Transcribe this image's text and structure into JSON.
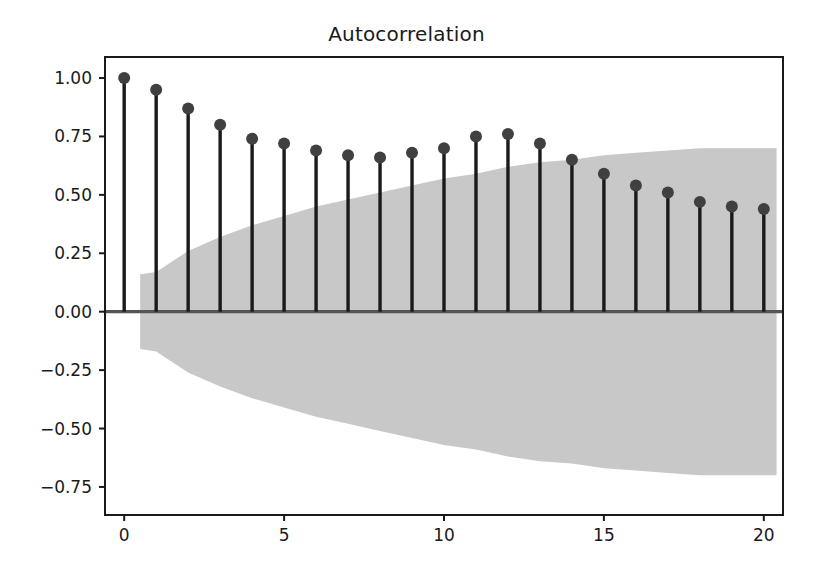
{
  "chart_data": {
    "type": "line",
    "plot_style": "stem",
    "title": "Autocorrelation",
    "xlabel": "",
    "ylabel": "",
    "x": [
      0,
      1,
      2,
      3,
      4,
      5,
      6,
      7,
      8,
      9,
      10,
      11,
      12,
      13,
      14,
      15,
      16,
      17,
      18,
      19,
      20
    ],
    "values": [
      1.0,
      0.95,
      0.87,
      0.8,
      0.74,
      0.72,
      0.69,
      0.67,
      0.66,
      0.68,
      0.7,
      0.75,
      0.76,
      0.72,
      0.65,
      0.59,
      0.54,
      0.51,
      0.47,
      0.45,
      0.44
    ],
    "series": [
      {
        "name": "acf",
        "values": [
          1.0,
          0.95,
          0.87,
          0.8,
          0.74,
          0.72,
          0.69,
          0.67,
          0.66,
          0.68,
          0.7,
          0.75,
          0.76,
          0.72,
          0.65,
          0.59,
          0.54,
          0.51,
          0.47,
          0.45,
          0.44
        ]
      }
    ],
    "confidence_band": {
      "label": "95% confidence interval",
      "x": [
        0.5,
        1,
        2,
        3,
        4,
        5,
        6,
        7,
        8,
        9,
        10,
        11,
        12,
        13,
        14,
        15,
        16,
        17,
        18,
        19,
        20,
        20.4
      ],
      "upper": [
        0.16,
        0.17,
        0.26,
        0.32,
        0.37,
        0.41,
        0.45,
        0.48,
        0.51,
        0.54,
        0.57,
        0.59,
        0.62,
        0.64,
        0.65,
        0.67,
        0.68,
        0.69,
        0.7,
        0.7,
        0.7,
        0.7
      ],
      "lower": [
        -0.16,
        -0.17,
        -0.26,
        -0.32,
        -0.37,
        -0.41,
        -0.45,
        -0.48,
        -0.51,
        -0.54,
        -0.57,
        -0.59,
        -0.62,
        -0.64,
        -0.65,
        -0.67,
        -0.68,
        -0.69,
        -0.7,
        -0.7,
        -0.7,
        -0.7
      ],
      "color": "#c8c8c8"
    },
    "xlim": [
      -0.6,
      20.6
    ],
    "ylim": [
      -0.87,
      1.09
    ],
    "xticks": [
      0,
      5,
      10,
      15,
      20
    ],
    "xticklabels": [
      "0",
      "5",
      "10",
      "15",
      "20"
    ],
    "yticks": [
      -0.75,
      -0.5,
      -0.25,
      0.0,
      0.25,
      0.5,
      0.75,
      1.0
    ],
    "yticklabels": [
      "−0.75",
      "−0.50",
      "−0.25",
      "0.00",
      "0.25",
      "0.50",
      "0.75",
      "1.00"
    ],
    "grid": false,
    "legend": "none",
    "marker": "circle",
    "marker_color": "#404040",
    "stem_color": "#1a1a1a",
    "baseline_color": "#555555",
    "axes_edge_color": "#1a1a1a",
    "background_color": "#ffffff"
  }
}
